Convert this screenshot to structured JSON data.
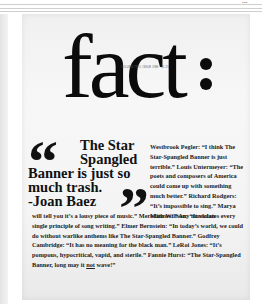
{
  "top_bar": {
    "label": "▪▪▪"
  },
  "cover": {
    "masthead": "fact",
    "issue_line": "VOLUME TWO, ISSUE ONE · $1.25",
    "pull_quote": {
      "lines": [
        "The Star",
        "Spangled",
        "Banner is just so",
        "much trash.",
        "-Joan Baez"
      ],
      "open_mark": "“",
      "close_mark": "”"
    },
    "side_column": "Westbrook Pegler: “I think The Star-Spangled Banner is just terrible.” Louis Untermeyer: “The poets and composers of America could come up with something much better.” Richard Rodgers: “It’s impossible to sing.” Marya Mannes: “Any musician",
    "bottom_text_main": "will tell you it’s a lousy piece of music.” Meredith Willson: “It violates every single principle of song writing.” Elmer Bernstein: “In today’s world, we could do without warlike anthems like The Star-Spangled Banner.” Godfrey Cambridge: “It has no meaning for the black man.” LeRoi Jones: “It’s pompous, hypocritical, vapid, and sterile.” Fannie Hurst: “The Star-Spangled Banner, long may it ",
    "bottom_text_underlined": "not",
    "bottom_text_end": " wave!”"
  }
}
